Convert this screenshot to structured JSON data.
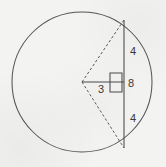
{
  "figure": {
    "kind": "circle-chord-geometry-diagram",
    "background_color": "#f3f3f2",
    "stroke_color": "#4a4a4a",
    "label_color": "#3a3a3a",
    "width": 166,
    "height": 167
  },
  "circle": {
    "name": "circle-outline",
    "center_x": 82,
    "center_y": 82,
    "radius": 70
  },
  "chord": {
    "name": "vertical-chord",
    "x": 124,
    "y_top": 20,
    "y_bottom": 148,
    "length_label": "8"
  },
  "perpendicular": {
    "name": "center-to-chord-segment",
    "from_x": 82,
    "from_y": 82,
    "to_x": 124,
    "to_y": 82,
    "length_label": "3"
  },
  "radii": [
    {
      "name": "radius-to-chord-top",
      "style": "dashed",
      "from_x": 82,
      "from_y": 82,
      "to_x": 124,
      "to_y": 20
    },
    {
      "name": "radius-to-chord-bottom",
      "style": "dashed",
      "from_x": 82,
      "from_y": 82,
      "to_x": 124,
      "to_y": 148
    }
  ],
  "right_angle": {
    "name": "right-angle-mark",
    "x": 110,
    "y": 73,
    "size": 12
  },
  "labels": {
    "upper_segment": "4",
    "chord_total": "8",
    "perpendicular_distance": "3",
    "lower_segment": "4"
  },
  "label_positions": {
    "upper_segment": {
      "x": 133,
      "y": 52
    },
    "chord_total": {
      "x": 131,
      "y": 84
    },
    "perpendicular_distance": {
      "x": 101,
      "y": 90
    },
    "lower_segment": {
      "x": 133,
      "y": 119
    }
  }
}
